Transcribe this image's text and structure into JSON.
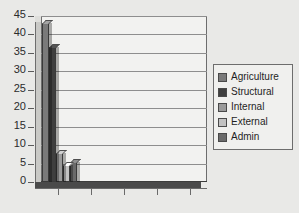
{
  "chart_data": {
    "type": "bar",
    "title": "",
    "subtitle": "",
    "xlabel": "",
    "ylabel": "",
    "categories": [
      "1"
    ],
    "series": [
      {
        "name": "Agriculture",
        "values": [
          43
        ],
        "color": "#7a7a7a"
      },
      {
        "name": "Structural",
        "values": [
          36.5
        ],
        "color": "#3f3f3f"
      },
      {
        "name": "Internal",
        "values": [
          8
        ],
        "color": "#9a9a9a"
      },
      {
        "name": "External",
        "values": [
          4.5
        ],
        "color": "#c2c2c2"
      },
      {
        "name": "Admin",
        "values": [
          5.5
        ],
        "color": "#6a6a6a"
      }
    ],
    "ylim": [
      0,
      45
    ],
    "ytick_step": 5,
    "yticks": [
      "45",
      "40",
      "35",
      "30",
      "25",
      "20",
      "15",
      "10",
      "5",
      "0"
    ],
    "xticks": [
      "",
      "",
      "",
      "",
      ""
    ],
    "grid": true,
    "legend_position": "right",
    "three_d": true
  },
  "legend": {
    "items": [
      {
        "label": "Agriculture",
        "color": "#7a7a7a"
      },
      {
        "label": "Structural",
        "color": "#3f3f3f"
      },
      {
        "label": "Internal",
        "color": "#9a9a9a"
      },
      {
        "label": "External",
        "color": "#c2c2c2"
      },
      {
        "label": "Admin",
        "color": "#6a6a6a"
      }
    ]
  },
  "colors": {
    "background": "#e9e9e7",
    "plot_background": "#f2f2f0",
    "gridline": "#8e8e8e",
    "axis": "#6a6a6a",
    "floor": "#4a4a4a",
    "text": "#2b2b2b"
  }
}
